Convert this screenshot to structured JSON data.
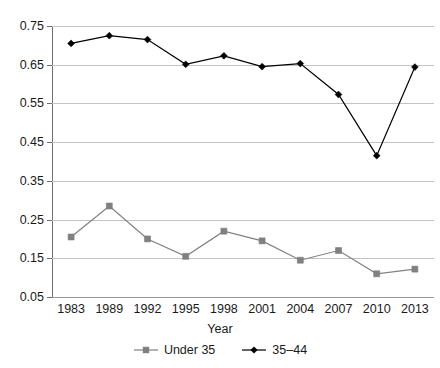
{
  "chart_data": {
    "type": "line",
    "title": "",
    "xlabel": "Year",
    "ylabel": "",
    "categories": [
      "1983",
      "1989",
      "1992",
      "1995",
      "1998",
      "2001",
      "2004",
      "2007",
      "2010",
      "2013"
    ],
    "ylim": [
      0.05,
      0.75
    ],
    "ytick_labels": [
      "0.05",
      "0.15",
      "0.25",
      "0.35",
      "0.45",
      "0.55",
      "0.65",
      "0.75"
    ],
    "ytick_values": [
      0.05,
      0.15,
      0.25,
      0.35,
      0.45,
      0.55,
      0.65,
      0.75
    ],
    "grid": true,
    "legend_position": "bottom",
    "series": [
      {
        "name": "Under 35",
        "color": "#808080",
        "marker": "square",
        "values": [
          0.205,
          0.285,
          0.2,
          0.155,
          0.22,
          0.195,
          0.145,
          0.17,
          0.11,
          0.122
        ]
      },
      {
        "name": "35–44",
        "color": "#000000",
        "marker": "diamond",
        "values": [
          0.705,
          0.725,
          0.715,
          0.651,
          0.673,
          0.645,
          0.653,
          0.573,
          0.415,
          0.644
        ]
      }
    ]
  },
  "axis": {
    "x_title": "Year"
  }
}
